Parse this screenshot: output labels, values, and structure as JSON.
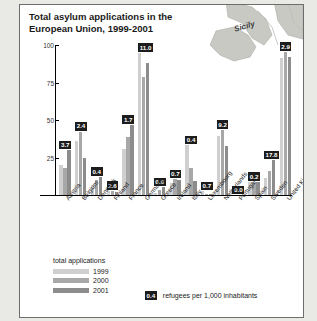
{
  "figure": {
    "map_label": "Sicily",
    "background_color": "#e9e9e6",
    "panel_color": "#ffffff"
  },
  "legend": {
    "title": "total applications",
    "entries": [
      {
        "label": "1999",
        "color": "#cfcfcf"
      },
      {
        "label": "2000",
        "color": "#a8a8a8"
      },
      {
        "label": "2001",
        "color": "#8c8c8c"
      }
    ],
    "refugee_badge_value": "0.4",
    "refugee_label": "refugees per 1,000 inhabitants"
  },
  "chart_data": {
    "type": "bar",
    "xlabel": "",
    "ylabel": "thousand applications",
    "ylim": [
      0,
      100
    ],
    "yticks": [
      25,
      50,
      75,
      100
    ],
    "grid": false,
    "legend_position": "bottom-left",
    "categories": [
      "Austria",
      "Belgium",
      "Denmark",
      "Finland",
      "France",
      "Germany",
      "Greece",
      "Ireland",
      "Italy",
      "Luxembourg",
      "Netherlands",
      "Portugal",
      "Spain",
      "Sweden",
      "United Kingdom"
    ],
    "series": [
      {
        "name": "1999",
        "color": "#cfcfcf",
        "values": [
          20.1,
          35.8,
          6.5,
          3.1,
          30.9,
          95.1,
          1.5,
          7.7,
          33.4,
          2.9,
          39.3,
          0.3,
          8.4,
          11.2,
          91.2
        ]
      },
      {
        "name": "2000",
        "color": "#a8a8a8",
        "values": [
          18.3,
          42.7,
          10.1,
          3.2,
          38.7,
          78.6,
          3.1,
          10.9,
          18.0,
          0.6,
          43.9,
          0.2,
          7.9,
          16.3,
          98.9
        ]
      },
      {
        "name": "2001",
        "color": "#8c8c8c",
        "values": [
          30.1,
          24.5,
          12.4,
          1.7,
          47.3,
          88.3,
          5.5,
          10.3,
          9.6,
          0.7,
          32.6,
          0.2,
          9.2,
          23.5,
          92.0
        ]
      }
    ],
    "annotations": {
      "name": "refugees per 1,000 inhabitants",
      "values": [
        {
          "category": "Austria",
          "value": "3.7"
        },
        {
          "category": "Belgium",
          "value": "2.4"
        },
        {
          "category": "Denmark",
          "value": "0.4"
        },
        {
          "category": "Finland",
          "value": "2.6"
        },
        {
          "category": "France",
          "value": "1.7"
        },
        {
          "category": "Germany",
          "value": "11.0"
        },
        {
          "category": "Greece",
          "value": "0.6"
        },
        {
          "category": "Ireland",
          "value": "0.7"
        },
        {
          "category": "Italy",
          "value": "0.4"
        },
        {
          "category": "Luxembourg",
          "value": "0.7"
        },
        {
          "category": "Netherlands",
          "value": "9.2"
        },
        {
          "category": "Portugal",
          "value": "0.0"
        },
        {
          "category": "Spain",
          "value": "0.2"
        },
        {
          "category": "Sweden",
          "value": "17.8"
        },
        {
          "category": "United Kingdom",
          "value": "2.9"
        }
      ]
    }
  }
}
